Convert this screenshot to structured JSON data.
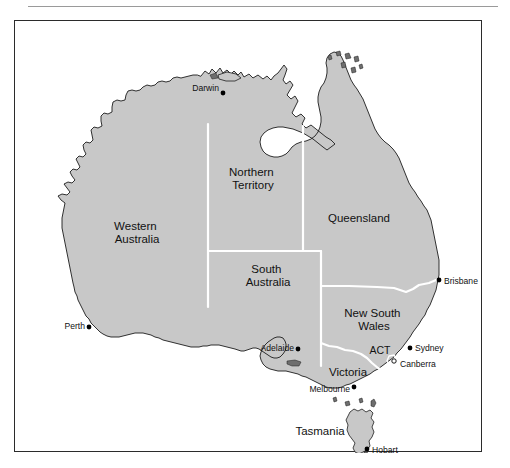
{
  "figure": {
    "has_top_rule": true,
    "frame_color": "#2b2b2b",
    "background_color": "#ffffff",
    "land_color": "#c8c8c8",
    "border_color": "#ffffff",
    "coast_color": "#1c1c1c"
  },
  "states": [
    {
      "id": "western-australia",
      "label_line1": "Western",
      "label_line2": "Australia",
      "x": 122,
      "y": 212
    },
    {
      "id": "northern-territory",
      "label_line1": "Northern",
      "label_line2": "Territory",
      "x": 238,
      "y": 158
    },
    {
      "id": "queensland",
      "label_line1": "Queensland",
      "label_line2": "",
      "x": 344,
      "y": 198
    },
    {
      "id": "south-australia",
      "label_line1": "South",
      "label_line2": "Australia",
      "x": 253,
      "y": 255
    },
    {
      "id": "new-south-wales",
      "label_line1": "New South",
      "label_line2": "Wales",
      "x": 359,
      "y": 299
    },
    {
      "id": "victoria",
      "label_line1": "Victoria",
      "label_line2": "",
      "x": 333,
      "y": 352
    },
    {
      "id": "tasmania",
      "label_line1": "Tasmania",
      "label_line2": "",
      "x": 305,
      "y": 411
    },
    {
      "id": "act",
      "label_line1": "ACT",
      "label_line2": "",
      "x": 365,
      "y": 330
    }
  ],
  "cities": [
    {
      "id": "darwin",
      "label": "Darwin",
      "dot_x": 208,
      "dot_y": 72,
      "label_x": 204,
      "label_y": 68,
      "align": "r"
    },
    {
      "id": "brisbane",
      "label": "Brisbane",
      "dot_x": 424,
      "dot_y": 259,
      "label_x": 429,
      "label_y": 261,
      "align": "l"
    },
    {
      "id": "perth",
      "label": "Perth",
      "dot_x": 74,
      "dot_y": 306,
      "label_x": 70,
      "label_y": 306,
      "align": "r"
    },
    {
      "id": "adelaide",
      "label": "Adelaide",
      "dot_x": 283,
      "dot_y": 328,
      "label_x": 279,
      "label_y": 328,
      "align": "r"
    },
    {
      "id": "sydney",
      "label": "Sydney",
      "dot_x": 395,
      "dot_y": 327,
      "label_x": 400,
      "label_y": 328,
      "align": "l"
    },
    {
      "id": "canberra",
      "label": "Canberra",
      "dot_x": 379,
      "dot_y": 340,
      "label_x": 385,
      "label_y": 344,
      "align": "l"
    },
    {
      "id": "melbourne",
      "label": "Melbourne",
      "dot_x": 339,
      "dot_y": 366,
      "label_x": 335,
      "label_y": 369,
      "align": "r"
    },
    {
      "id": "hobart",
      "label": "Hobart",
      "dot_x": 352,
      "dot_y": 428,
      "label_x": 357,
      "label_y": 430,
      "align": "l"
    }
  ]
}
